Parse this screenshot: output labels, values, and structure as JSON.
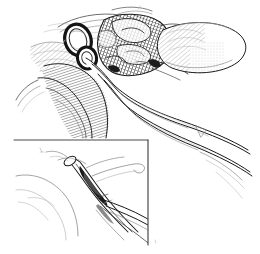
{
  "figure": {
    "domain_kind": "anatomical-line-illustration",
    "medium": "pen-and-ink line drawing",
    "palette": {
      "background": "#ffffff",
      "ink_dark": "#1a1a1a",
      "ink_mid": "#4a4a4a",
      "ink_soft": "#8a8a8a",
      "ink_faint": "#b8b8b8"
    },
    "canvas": {
      "width": 260,
      "height": 254
    }
  },
  "main_panel": {
    "name": "main-surgical-view",
    "region": {
      "x": 30,
      "y": 8,
      "width": 230,
      "height": 140
    },
    "elements": [
      {
        "id": "vessel-ring-upper",
        "label": "upper vessel cross-section",
        "cx": 78,
        "cy": 40
      },
      {
        "id": "vessel-ring-lower",
        "label": "lower vessel cross-section",
        "cx": 86,
        "cy": 56
      },
      {
        "id": "tissue-mass",
        "label": "cross-hatched tissue mass",
        "cx": 128,
        "cy": 45
      },
      {
        "id": "retracted-lobe",
        "label": "retracted bulbous lobe",
        "cx": 210,
        "cy": 48
      },
      {
        "id": "muscle-band",
        "label": "hatched muscle band",
        "cx": 95,
        "cy": 95
      },
      {
        "id": "catheter-bundle",
        "label": "catheter / drain tubes",
        "cx": 180,
        "cy": 115
      }
    ]
  },
  "inset_panel": {
    "name": "inset-closeup",
    "label": "close-up inset",
    "border_sides": "top-and-right",
    "frame": {
      "x": 14,
      "y": 140,
      "width": 134,
      "height": 114
    },
    "elements": [
      {
        "id": "clamp-instrument",
        "label": "clamp / forceps instrument",
        "cx": 82,
        "cy": 175
      },
      {
        "id": "grasped-vessel",
        "label": "grasped vessel",
        "cx": 92,
        "cy": 185
      },
      {
        "id": "suture-loop",
        "label": "curved suture loop",
        "cx": 118,
        "cy": 168
      },
      {
        "id": "tissue-edge",
        "label": "soft tissue contour",
        "cx": 48,
        "cy": 190
      }
    ]
  },
  "marks": {
    "inset_tick_label": "",
    "bottom_tick_label": ""
  }
}
